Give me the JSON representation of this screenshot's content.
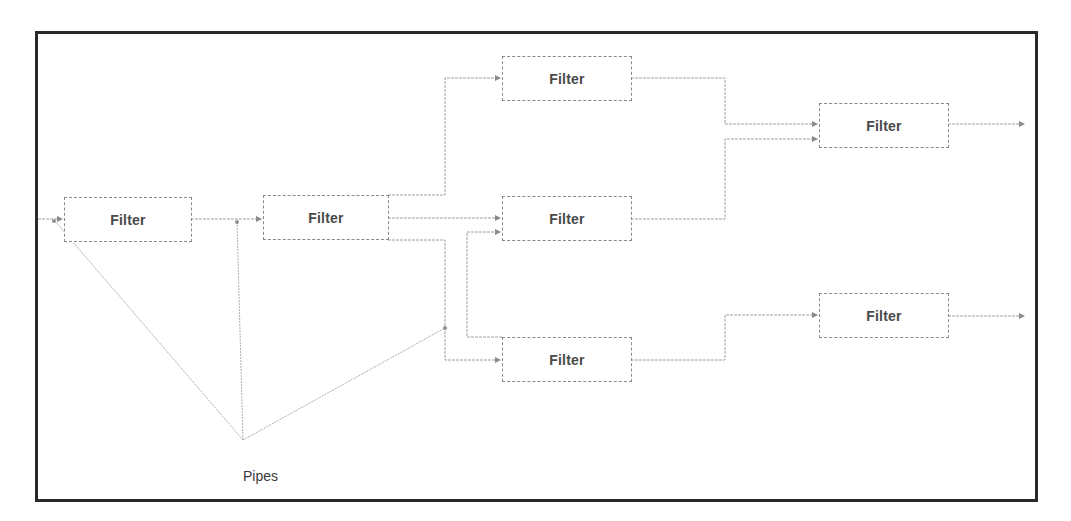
{
  "diagram": {
    "type": "pipes-and-filters",
    "filters": [
      {
        "id": "f1",
        "label": "Filter"
      },
      {
        "id": "f2",
        "label": "Filter"
      },
      {
        "id": "f3",
        "label": "Filter"
      },
      {
        "id": "f4",
        "label": "Filter"
      },
      {
        "id": "f5",
        "label": "Filter"
      },
      {
        "id": "f6",
        "label": "Filter"
      },
      {
        "id": "f7",
        "label": "Filter"
      }
    ],
    "connections": [
      {
        "from": "input",
        "to": "f1"
      },
      {
        "from": "f1",
        "to": "f2"
      },
      {
        "from": "f2",
        "to": "f3"
      },
      {
        "from": "f2",
        "to": "f4"
      },
      {
        "from": "f2",
        "to": "f5"
      },
      {
        "from": "f5",
        "to": "f4"
      },
      {
        "from": "f3",
        "to": "f6"
      },
      {
        "from": "f4",
        "to": "f6"
      },
      {
        "from": "f5",
        "to": "f7"
      },
      {
        "from": "f6",
        "to": "output"
      },
      {
        "from": "f7",
        "to": "output"
      }
    ],
    "annotation": {
      "label": "Pipes"
    },
    "colors": {
      "frame": "#2a2a2a",
      "lines": "#9a9a9a",
      "text": "#4a4a4a"
    }
  }
}
